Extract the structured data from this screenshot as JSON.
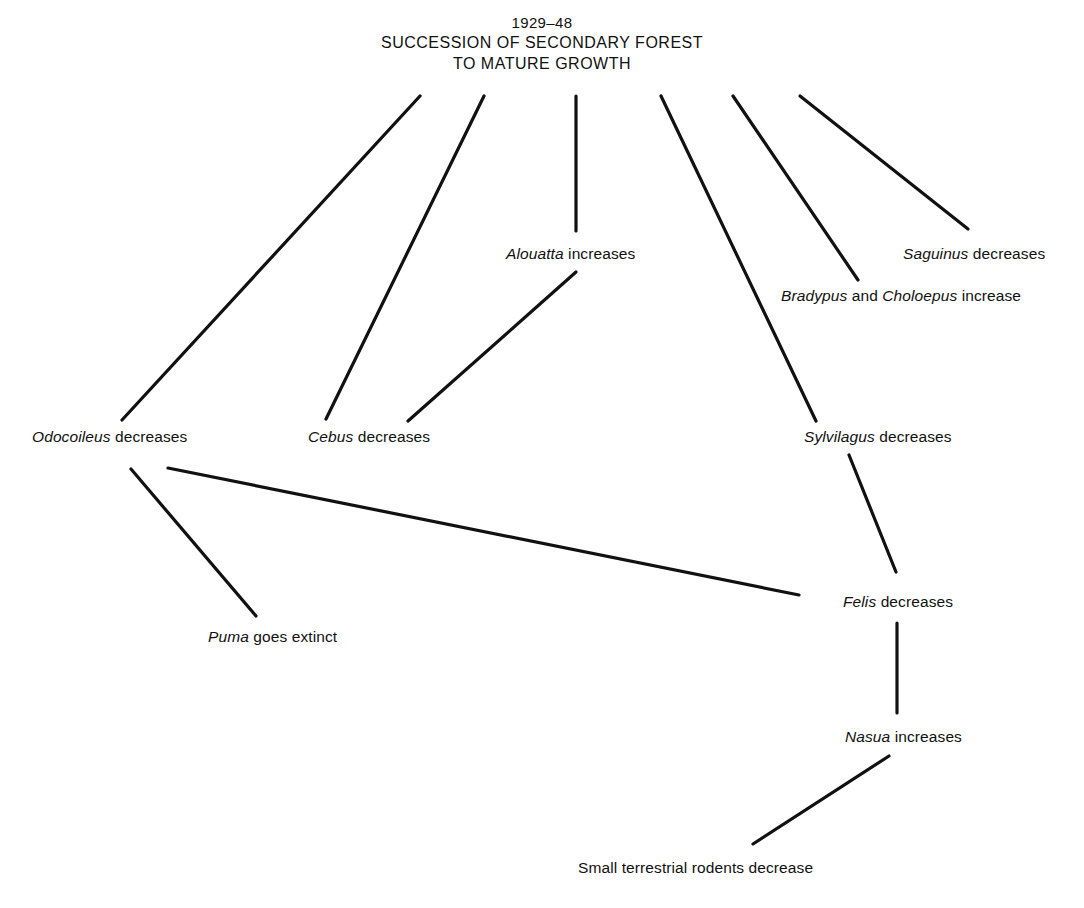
{
  "figure": {
    "kind": "food-web-succession-diagram",
    "background_color": "#ffffff",
    "ink_color": "#111111"
  },
  "title": {
    "year_range": "1929–48",
    "line1": "SUCCESSION OF SECONDARY FOREST",
    "line2": "TO MATURE GROWTH"
  },
  "nodes": [
    {
      "id": "odocoileus",
      "genus": "Odocoileus",
      "rest": " decreases",
      "x": 32,
      "y": 437,
      "align": "left"
    },
    {
      "id": "cebus",
      "genus": "Cebus",
      "rest": " decreases",
      "x": 308,
      "y": 437,
      "align": "left"
    },
    {
      "id": "alouatta",
      "genus": "Alouatta",
      "rest": " increases",
      "x": 506,
      "y": 254,
      "align": "left"
    },
    {
      "id": "sylvilagus",
      "genus": "Sylvilagus",
      "rest": " decreases",
      "x": 804,
      "y": 437,
      "align": "left"
    },
    {
      "id": "bradypus-choloepus",
      "genus": "Bradypus",
      "rest": " and ",
      "genus2": "Choloepus",
      "rest2": " increase",
      "x": 781,
      "y": 296,
      "align": "left"
    },
    {
      "id": "saguinus",
      "genus": "Saguinus",
      "rest": " decreases",
      "x": 903,
      "y": 254,
      "align": "left"
    },
    {
      "id": "puma",
      "genus": "Puma",
      "rest": " goes extinct",
      "x": 208,
      "y": 637,
      "align": "left"
    },
    {
      "id": "felis",
      "genus": "Felis",
      "rest": " decreases",
      "x": 843,
      "y": 602,
      "align": "left"
    },
    {
      "id": "nasua",
      "genus": "Nasua",
      "rest": " increases",
      "x": 845,
      "y": 737,
      "align": "left"
    },
    {
      "id": "small-rodents",
      "genus": "",
      "rest": "Small terrestrial rodents decrease",
      "x": 578,
      "y": 868,
      "align": "left"
    }
  ],
  "edges": [
    {
      "id": "title-to-odocoileus",
      "from": "title",
      "to": "odocoileus",
      "x1": 420,
      "y1": 96,
      "x2": 122,
      "y2": 420
    },
    {
      "id": "title-to-cebus",
      "from": "title",
      "to": "cebus",
      "x1": 484,
      "y1": 96,
      "x2": 326,
      "y2": 419
    },
    {
      "id": "title-to-alouatta",
      "from": "title",
      "to": "alouatta",
      "x1": 576,
      "y1": 96,
      "x2": 576,
      "y2": 231
    },
    {
      "id": "title-to-sylvilagus",
      "from": "title",
      "to": "sylvilagus",
      "x1": 661,
      "y1": 96,
      "x2": 816,
      "y2": 421
    },
    {
      "id": "title-to-bradypus",
      "from": "title",
      "to": "bradypus-choloepus",
      "x1": 733,
      "y1": 96,
      "x2": 858,
      "y2": 280
    },
    {
      "id": "title-to-saguinus",
      "from": "title",
      "to": "saguinus",
      "x1": 800,
      "y1": 96,
      "x2": 968,
      "y2": 229
    },
    {
      "id": "cebus-to-alouatta",
      "from": "cebus",
      "to": "alouatta",
      "x1": 408,
      "y1": 421,
      "x2": 576,
      "y2": 272
    },
    {
      "id": "odocoileus-to-puma",
      "from": "odocoileus",
      "to": "puma",
      "x1": 131,
      "y1": 469,
      "x2": 256,
      "y2": 616
    },
    {
      "id": "odocoileus-to-felis",
      "from": "odocoileus",
      "to": "felis",
      "x1": 168,
      "y1": 468,
      "x2": 799,
      "y2": 595
    },
    {
      "id": "sylvilagus-to-felis",
      "from": "sylvilagus",
      "to": "felis",
      "x1": 849,
      "y1": 455,
      "x2": 896,
      "y2": 572
    },
    {
      "id": "felis-to-nasua",
      "from": "felis",
      "to": "nasua",
      "x1": 897,
      "y1": 623,
      "x2": 897,
      "y2": 713
    },
    {
      "id": "nasua-to-small-rodents",
      "from": "nasua",
      "to": "small-rodents",
      "x1": 889,
      "y1": 756,
      "x2": 753,
      "y2": 844
    }
  ]
}
